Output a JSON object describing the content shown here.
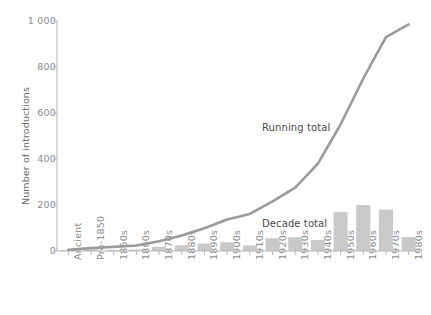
{
  "chart_data": {
    "type": "bar",
    "title": "",
    "xlabel": "",
    "ylabel": "Number of introductions",
    "ylim": [
      0,
      1000
    ],
    "yticks": [
      0,
      200,
      400,
      600,
      800,
      1000
    ],
    "ytick_labels": [
      "0",
      "200",
      "400",
      "600",
      "800",
      "1 000"
    ],
    "grid": false,
    "legend": "none",
    "categories": [
      "Ancient",
      "Pre-1850",
      "1850s",
      "1860s",
      "1870s",
      "1880s",
      "1890s",
      "1900s",
      "1910s",
      "1920s",
      "1930s",
      "1940s",
      "1950s",
      "1960s",
      "1970s",
      "1980s"
    ],
    "series": [
      {
        "name": "Decade total",
        "type": "bar",
        "color": "#c9c9c9",
        "values": [
          5,
          8,
          5,
          6,
          18,
          25,
          32,
          38,
          24,
          55,
          60,
          48,
          170,
          200,
          180,
          60
        ]
      },
      {
        "name": "Running total",
        "type": "line",
        "color": "#9a9a9a",
        "values": [
          5,
          13,
          18,
          24,
          42,
          67,
          99,
          137,
          161,
          216,
          276,
          380,
          550,
          750,
          930,
          985
        ]
      }
    ],
    "annotations": [
      {
        "text": "Running total",
        "x_px": 262,
        "y_px": 122
      },
      {
        "text": "Decade total",
        "x_px": 262,
        "y_px": 218
      }
    ]
  },
  "colors": {
    "bar": "#c9c9c9",
    "line": "#9a9a9a",
    "axis": "#b5b5b5",
    "tick_text": "#8a8a8a",
    "annotation_text": "#4a4a4a",
    "axis_title": "#6b6b6b",
    "background": "#ffffff"
  }
}
